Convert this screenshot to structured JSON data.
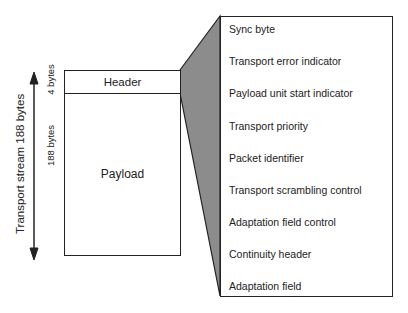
{
  "diagram": {
    "stream_label": "Transport stream 188 bytes",
    "packet": {
      "header_label": "Header",
      "header_size": "4 bytes",
      "payload_label": "Payload",
      "payload_size": "188 bytes"
    },
    "header_fields": [
      "Sync byte",
      "Transport error indicator",
      "Payload unit start indicator",
      "Transport priority",
      "Packet identifier",
      "Transport scrambling control",
      "Adaptation field control",
      "Continuity header",
      "Adaptation field"
    ],
    "colors": {
      "expansion_fill": "#8c8c8c",
      "stroke": "#222222"
    }
  }
}
